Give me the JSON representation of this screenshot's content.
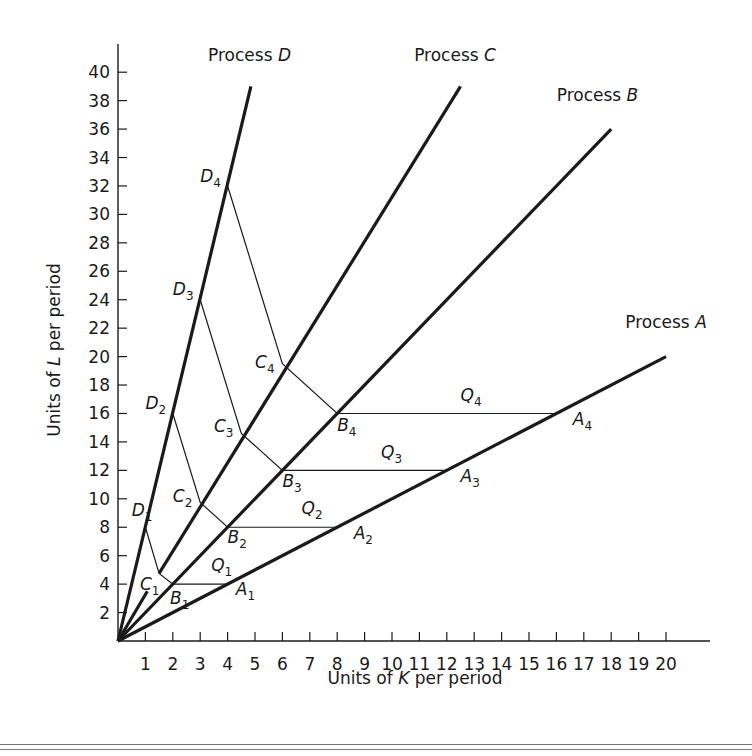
{
  "chart_data": {
    "type": "line",
    "title": "",
    "xlabel": "Units of K per period",
    "ylabel": "Units of L per period",
    "xlim": [
      0,
      22
    ],
    "ylim": [
      0,
      42
    ],
    "x_ticks": [
      1,
      2,
      3,
      4,
      5,
      6,
      7,
      8,
      9,
      10,
      11,
      12,
      13,
      14,
      15,
      16,
      17,
      18,
      19,
      20
    ],
    "y_ticks": [
      2,
      4,
      6,
      8,
      10,
      12,
      14,
      16,
      18,
      20,
      22,
      24,
      26,
      28,
      30,
      32,
      34,
      36,
      38,
      40
    ],
    "grid": false,
    "legend": null,
    "series": [
      {
        "name": "Process A",
        "kind": "ray",
        "points": [
          [
            0,
            0
          ],
          [
            4,
            4
          ],
          [
            8,
            8
          ],
          [
            12,
            12
          ],
          [
            16,
            16
          ],
          [
            20,
            20
          ]
        ],
        "label_pos": [
          20,
          22
        ]
      },
      {
        "name": "Process B",
        "kind": "ray",
        "points": [
          [
            0,
            0
          ],
          [
            2,
            4
          ],
          [
            4,
            8
          ],
          [
            6,
            12
          ],
          [
            8,
            16
          ],
          [
            18,
            36
          ]
        ],
        "label_pos": [
          17.5,
          38
        ]
      },
      {
        "name": "Process C",
        "kind": "ray",
        "points": [
          [
            0,
            0
          ],
          [
            1.5,
            4.75
          ],
          [
            3,
            9.75
          ],
          [
            4.5,
            14.6
          ],
          [
            6,
            19.5
          ],
          [
            12.5,
            39
          ]
        ],
        "label_pos": [
          12.3,
          40.8
        ],
        "gap": [
          [
            1.07,
            3.5
          ],
          [
            1.5,
            4.75
          ]
        ]
      },
      {
        "name": "Process D",
        "kind": "ray",
        "points": [
          [
            0,
            0
          ],
          [
            1,
            8
          ],
          [
            2,
            16
          ],
          [
            3,
            24
          ],
          [
            4,
            32
          ],
          [
            4.85,
            39
          ]
        ],
        "label_pos": [
          4.8,
          40.8
        ]
      }
    ],
    "isoquants": [
      {
        "name": "Q1",
        "points": [
          [
            1,
            8
          ],
          [
            1.5,
            4.75
          ],
          [
            2,
            4
          ],
          [
            4,
            4
          ]
        ],
        "label_pos": [
          3.4,
          4.9
        ]
      },
      {
        "name": "Q2",
        "points": [
          [
            2,
            16
          ],
          [
            3,
            9.75
          ],
          [
            4,
            8
          ],
          [
            8,
            8
          ]
        ],
        "label_pos": [
          6.7,
          8.9
        ]
      },
      {
        "name": "Q3",
        "points": [
          [
            3,
            24
          ],
          [
            4.5,
            14.6
          ],
          [
            6,
            12
          ],
          [
            12,
            12
          ]
        ],
        "label_pos": [
          9.6,
          12.9
        ]
      },
      {
        "name": "Q4",
        "points": [
          [
            4,
            32
          ],
          [
            6,
            19.5
          ],
          [
            8,
            16
          ],
          [
            16,
            16
          ]
        ],
        "label_pos": [
          12.5,
          16.9
        ]
      }
    ],
    "point_labels": [
      {
        "base": "A",
        "sub": "1",
        "at": [
          4.3,
          3.2
        ]
      },
      {
        "base": "A",
        "sub": "2",
        "at": [
          8.6,
          7.2
        ]
      },
      {
        "base": "A",
        "sub": "3",
        "at": [
          12.5,
          11.2
        ]
      },
      {
        "base": "A",
        "sub": "4",
        "at": [
          16.6,
          15.2
        ]
      },
      {
        "base": "B",
        "sub": "1",
        "at": [
          1.9,
          2.6
        ]
      },
      {
        "base": "B",
        "sub": "2",
        "at": [
          4.0,
          6.9
        ]
      },
      {
        "base": "B",
        "sub": "3",
        "at": [
          6.0,
          10.8
        ]
      },
      {
        "base": "B",
        "sub": "4",
        "at": [
          8.0,
          14.8
        ]
      },
      {
        "base": "C",
        "sub": "1",
        "at": [
          0.8,
          3.6
        ]
      },
      {
        "base": "C",
        "sub": "2",
        "at": [
          2.0,
          9.8
        ]
      },
      {
        "base": "C",
        "sub": "3",
        "at": [
          3.5,
          14.7
        ]
      },
      {
        "base": "C",
        "sub": "4",
        "at": [
          5.0,
          19.2
        ]
      },
      {
        "base": "D",
        "sub": "1",
        "at": [
          0.5,
          8.8
        ]
      },
      {
        "base": "D",
        "sub": "2",
        "at": [
          1.0,
          16.3
        ]
      },
      {
        "base": "D",
        "sub": "3",
        "at": [
          2.0,
          24.3
        ]
      },
      {
        "base": "D",
        "sub": "4",
        "at": [
          3.0,
          32.3
        ]
      }
    ]
  },
  "labels": {
    "xlabel_pre": "Units of ",
    "xlabel_var": "K",
    "xlabel_post": " per period",
    "ylabel_pre": "Units of ",
    "ylabel_var": "L",
    "ylabel_post": " per period",
    "process_prefix": "Process "
  },
  "style": {
    "ink": "#1a1a1a",
    "background": "#ffffff",
    "rule": "#777777"
  }
}
